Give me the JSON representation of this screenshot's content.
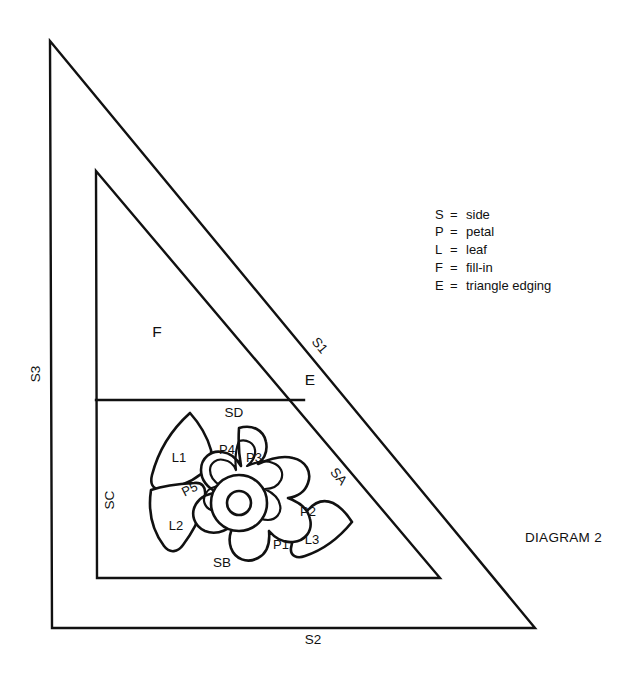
{
  "caption": "DIAGRAM 2",
  "legend": {
    "separator": "=",
    "entries": [
      {
        "key": "S",
        "meaning": "side"
      },
      {
        "key": "P",
        "meaning": "petal"
      },
      {
        "key": "L",
        "meaning": "leaf"
      },
      {
        "key": "F",
        "meaning": "fill-in"
      },
      {
        "key": "E",
        "meaning": "triangle edging"
      }
    ]
  },
  "outer_triangle": {
    "labels": {
      "s1": "S1",
      "s2": "S2",
      "s3": "S3"
    }
  },
  "inner_triangle": {
    "labels": {
      "sa": "SA",
      "sb": "SB",
      "sc": "SC",
      "sd": "SD"
    }
  },
  "regions": {
    "fill_in": "F",
    "edging": "E"
  },
  "motif": {
    "petals": [
      "P1",
      "P2",
      "P3",
      "P4",
      "P5"
    ],
    "leaves": [
      "L1",
      "L2",
      "L3"
    ]
  },
  "colors": {
    "ink": "#111111",
    "paper": "#ffffff"
  }
}
